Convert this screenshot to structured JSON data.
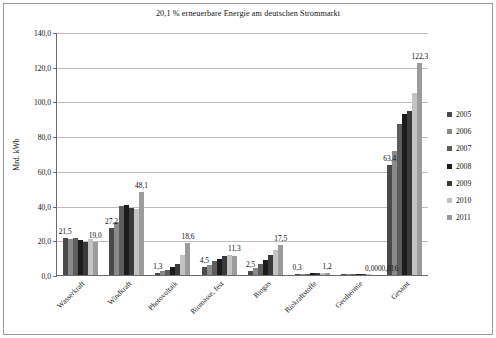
{
  "chart": {
    "title": "20,1 % erneuerbare Energie am deutschen Strommarkt",
    "ylabel": "Mrd. kWh"
  },
  "chart_data": {
    "type": "bar",
    "title": "20,1 % erneuerbare Energie am deutschen Strommarkt",
    "xlabel": "",
    "ylabel": "Mrd. kWh",
    "ylim": [
      0,
      140
    ],
    "ytick_values": [
      0,
      20,
      40,
      60,
      80,
      100,
      120,
      140
    ],
    "ytick_labels": [
      "0,0",
      "20,0",
      "40,0",
      "60,0",
      "80,0",
      "100,0",
      "120,0",
      "140,0"
    ],
    "grid": true,
    "legend_position": "right",
    "categories": [
      "Wasserkraft",
      "Windkraft",
      "Photovoltaik",
      "Biomasse, fest",
      "Biogas",
      "Biokraftstoffe",
      "Geothermie",
      "Gesamt"
    ],
    "series": [
      {
        "name": "2005",
        "color": "#4a4a4a",
        "values": [
          21.5,
          27.2,
          1.3,
          4.5,
          2.5,
          0.3,
          0.016,
          63.4
        ]
      },
      {
        "name": "2006",
        "color": "#8a8a8a",
        "values": [
          21.0,
          30.7,
          2.2,
          6.0,
          4.0,
          0.5,
          0.02,
          71.6
        ]
      },
      {
        "name": "2007",
        "color": "#5d5d5d",
        "values": [
          21.2,
          39.7,
          3.1,
          8.0,
          6.2,
          0.7,
          0.02,
          87.2
        ]
      },
      {
        "name": "2008",
        "color": "#1c1c1c",
        "values": [
          20.4,
          40.6,
          4.4,
          9.5,
          8.4,
          0.9,
          0.02,
          92.6
        ]
      },
      {
        "name": "2009",
        "color": "#3a3a3a",
        "values": [
          19.0,
          38.6,
          6.6,
          10.7,
          11.3,
          1.0,
          0.02,
          94.3
        ]
      },
      {
        "name": "2010",
        "color": "#c3c3c3",
        "values": [
          21.0,
          37.8,
          11.7,
          11.3,
          14.4,
          1.1,
          0.02,
          104.8
        ]
      },
      {
        "name": "2011",
        "color": "#9b9b9b",
        "values": [
          19.0,
          48.1,
          18.6,
          11.1,
          17.5,
          1.2,
          0.0,
          122.3
        ]
      }
    ],
    "data_labels": [
      {
        "category": "Wasserkraft",
        "text": "21,5",
        "value": 21.5,
        "series": "2005"
      },
      {
        "category": "Wasserkraft",
        "text": "19,0",
        "value": 19.0,
        "series": "2011"
      },
      {
        "category": "Windkraft",
        "text": "27,2",
        "value": 27.2,
        "series": "2005"
      },
      {
        "category": "Windkraft",
        "text": "48,1",
        "value": 48.1,
        "series": "2011"
      },
      {
        "category": "Photovoltaik",
        "text": "1,3",
        "value": 1.3,
        "series": "2005"
      },
      {
        "category": "Photovoltaik",
        "text": "18,6",
        "value": 18.6,
        "series": "2011"
      },
      {
        "category": "Biomasse, fest",
        "text": "4,5",
        "value": 4.5,
        "series": "2005"
      },
      {
        "category": "Biomasse, fest",
        "text": "11,3",
        "value": 11.3,
        "series": "2011"
      },
      {
        "category": "Biogas",
        "text": "2,5",
        "value": 2.5,
        "series": "2005"
      },
      {
        "category": "Biogas",
        "text": "17,5",
        "value": 17.5,
        "series": "2011"
      },
      {
        "category": "Biokraftstoffe",
        "text": "0,3",
        "value": 0.3,
        "series": "2005"
      },
      {
        "category": "Biokraftstoffe",
        "text": "1,2",
        "value": 1.2,
        "series": "2011"
      },
      {
        "category": "Geothermie",
        "text": "0,000",
        "value": 0.0,
        "series": "2011"
      },
      {
        "category": "Gesamt",
        "text": "0,016",
        "value": 0.016,
        "series": "2005"
      },
      {
        "category": "Gesamt",
        "text": "63,4",
        "value": 63.4,
        "series": "2005"
      },
      {
        "category": "Gesamt",
        "text": "122,3",
        "value": 122.3,
        "series": "2011"
      }
    ]
  }
}
